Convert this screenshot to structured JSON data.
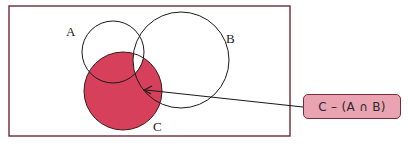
{
  "diagram": {
    "type": "venn",
    "sets": [
      {
        "name": "A",
        "label": "A"
      },
      {
        "name": "B",
        "label": "B"
      },
      {
        "name": "C",
        "label": "C"
      }
    ],
    "shaded_region": "C − (A ∩ B)",
    "callout": {
      "text": "C – (A ∩ B)"
    },
    "colors": {
      "shade": "#d6405a",
      "frame": "#6b2a36",
      "callout_fill": "#e9a3b1",
      "callout_border": "#7a2b3a",
      "outline": "#1a1a1a"
    }
  }
}
